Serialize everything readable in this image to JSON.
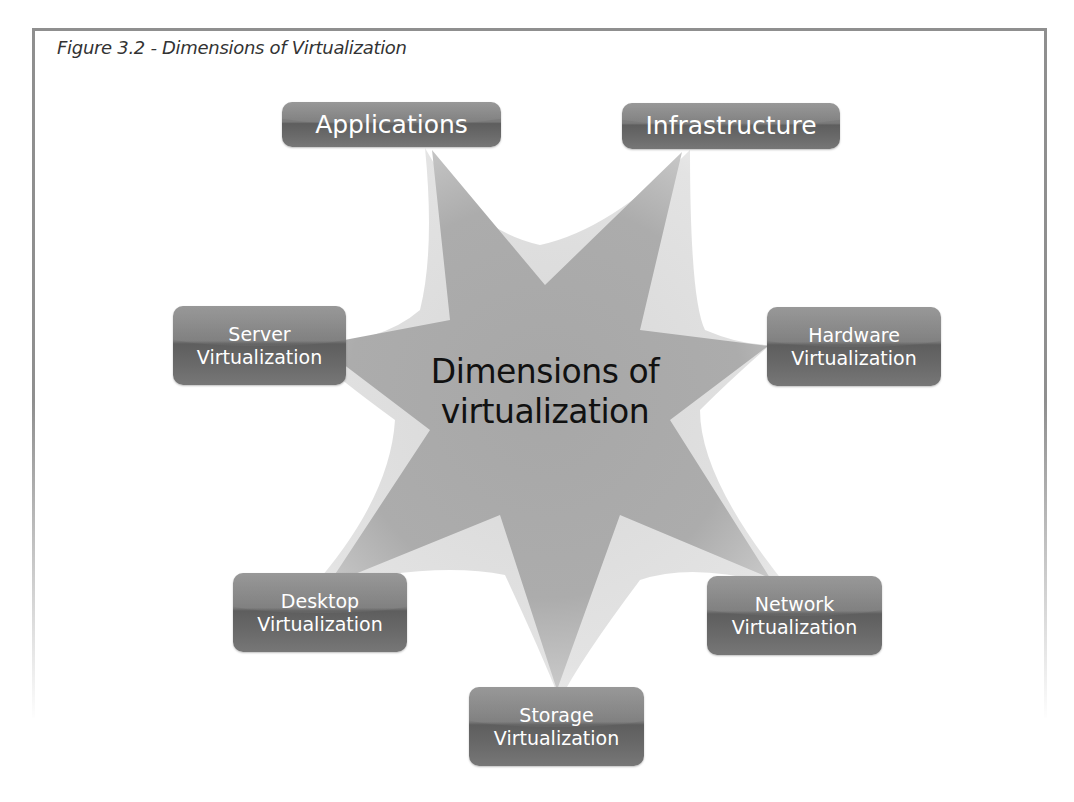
{
  "figure": {
    "caption": "Figure  3.2 - Dimensions of Virtualization"
  },
  "center": {
    "line1": "Dimensions of",
    "line2": "virtualization"
  },
  "nodes": [
    {
      "id": "applications",
      "line1": "Applications",
      "line2": ""
    },
    {
      "id": "infrastructure",
      "line1": "Infrastructure",
      "line2": ""
    },
    {
      "id": "server",
      "line1": "Server",
      "line2": "Virtualization"
    },
    {
      "id": "hardware",
      "line1": "Hardware",
      "line2": "Virtualization"
    },
    {
      "id": "desktop",
      "line1": "Desktop",
      "line2": "Virtualization"
    },
    {
      "id": "network",
      "line1": "Network",
      "line2": "Virtualization"
    },
    {
      "id": "storage",
      "line1": "Storage",
      "line2": "Virtualization"
    }
  ],
  "colors": {
    "frame": "#8f8f8f",
    "star_inner": "#a9a9a9",
    "star_outer": "#d9d9d9",
    "node_fill": "#6e6e6e",
    "node_text": "#ffffff",
    "center_text": "#111111"
  }
}
